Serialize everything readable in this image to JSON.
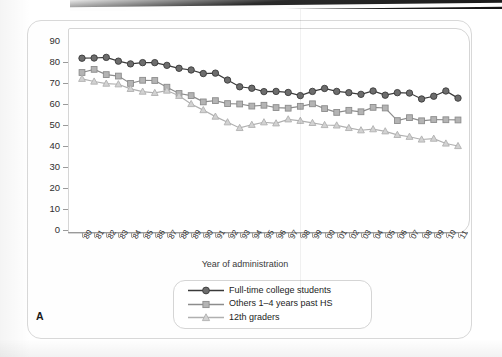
{
  "figure": {
    "panel_label": "A",
    "y_axis_label": "Percent",
    "x_axis_label": "Year of administration"
  },
  "legend": {
    "position": "bottom-center",
    "items": [
      {
        "label": "Full-time college students",
        "marker": "circle-filled-icon",
        "color": "#6d6d6d",
        "line_color": "#3a3a3a"
      },
      {
        "label": "Others 1–4 years past HS",
        "marker": "square-icon",
        "color": "#b4b4b4",
        "line_color": "#8c8c8c"
      },
      {
        "label": "12th graders",
        "marker": "triangle-icon",
        "color": "#d2d2d2",
        "line_color": "#b0b0b0"
      }
    ]
  },
  "chart_data": {
    "type": "line",
    "title": "",
    "xlabel": "Year of administration",
    "ylabel": "Percent",
    "ylim": [
      0,
      90
    ],
    "ytick_values": [
      0,
      10,
      20,
      30,
      40,
      50,
      60,
      70,
      80,
      90
    ],
    "grid": false,
    "legend_position": "bottom-center",
    "categories": [
      "'80",
      "'81",
      "'82",
      "'83",
      "'84",
      "'85",
      "'86",
      "'87",
      "'88",
      "'89",
      "'90",
      "'91",
      "'92",
      "'93",
      "'94",
      "'95",
      "'96",
      "'97",
      "'98",
      "'99",
      "'00",
      "'01",
      "'02",
      "'03",
      "'04",
      "'05",
      "'06",
      "'07",
      "'08",
      "'09",
      "'10",
      "'11"
    ],
    "series": [
      {
        "name": "Full-time college students",
        "color": "#6d6d6d",
        "line_color": "#3a3a3a",
        "marker": "circle",
        "values": [
          81.8,
          81.9,
          82.2,
          80.4,
          79.1,
          79.7,
          79.7,
          78.4,
          77.0,
          76.2,
          74.5,
          74.7,
          71.4,
          68.2,
          67.5,
          65.9,
          66.0,
          65.5,
          64.0,
          66.0,
          67.4,
          66.0,
          65.4,
          64.6,
          66.2,
          64.2,
          65.4,
          65.2,
          62.4,
          63.7,
          66.2,
          62.8
        ]
      },
      {
        "name": "Others 1–4 years past HS",
        "color": "#b4b4b4",
        "line_color": "#8c8c8c",
        "marker": "square",
        "values": [
          75.0,
          76.5,
          74.0,
          73.3,
          69.8,
          71.3,
          71.2,
          68.0,
          65.0,
          64.0,
          61.0,
          61.6,
          60.2,
          60.0,
          59.0,
          59.4,
          58.3,
          58.0,
          58.9,
          60.1,
          57.8,
          56.0,
          57.0,
          56.3,
          58.4,
          58.1,
          52.1,
          53.5,
          52.0,
          52.6,
          52.5,
          52.4
        ]
      },
      {
        "name": "12th graders",
        "color": "#d2d2d2",
        "line_color": "#b0b0b0",
        "marker": "triangle",
        "values": [
          72.0,
          70.7,
          69.7,
          69.4,
          67.2,
          65.9,
          65.3,
          66.4,
          63.9,
          60.0,
          57.1,
          54.0,
          51.3,
          48.6,
          50.1,
          51.3,
          50.8,
          52.7,
          52.0,
          51.0,
          50.0,
          49.8,
          48.6,
          47.5,
          48.0,
          47.0,
          45.3,
          44.4,
          43.1,
          43.5,
          41.2,
          40.0
        ]
      }
    ]
  }
}
